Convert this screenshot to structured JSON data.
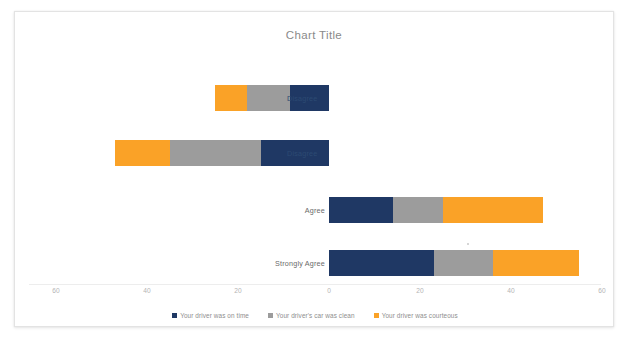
{
  "chart": {
    "title": "Chart Title",
    "background": "#ffffff"
  },
  "colors": {
    "on_time": "#1F3864",
    "car_clean": "#9C9C9C",
    "courteous": "#FAA227"
  },
  "legend": {
    "items": [
      {
        "label": "Your driver was on time",
        "color": "#1F3864",
        "key": "on_time"
      },
      {
        "label": "Your driver's car was clean",
        "color": "#9C9C9C",
        "key": "car_clean"
      },
      {
        "label": "Your driver was courteous",
        "color": "#FAA227",
        "key": "courteous"
      }
    ]
  },
  "axis": {
    "ticks": [
      "60",
      "40",
      "20",
      "0",
      "20",
      "40",
      "60"
    ],
    "tick_values": [
      -60,
      -40,
      -20,
      0,
      20,
      40,
      60
    ],
    "min": -60,
    "max": 60
  },
  "categories": {
    "labels": [
      "Disagree",
      "Disagree",
      "Agree",
      "Strongly Agree"
    ],
    "label_0": "Disagree",
    "label_1": "Disagree",
    "label_2": "Agree",
    "label_3": "Strongly Agree"
  },
  "chart_data": {
    "type": "bar",
    "subtype": "diverging-stacked-bar",
    "orientation": "horizontal",
    "title": "Chart Title",
    "xlabel": "",
    "ylabel": "",
    "xlim": [
      -60,
      60
    ],
    "grid": false,
    "legend_position": "bottom",
    "categories": [
      "Disagree",
      "Disagree",
      "Agree",
      "Strongly Agree"
    ],
    "series": [
      {
        "name": "Your driver was on time",
        "color": "#1F3864",
        "values": [
          -8.5,
          -15,
          14,
          23
        ]
      },
      {
        "name": "Your driver's car was clean",
        "color": "#9C9C9C",
        "values": [
          -9.5,
          -20,
          11,
          13
        ]
      },
      {
        "name": "Your driver was courteous",
        "color": "#FAA227",
        "values": [
          -7,
          -12,
          22,
          19
        ]
      }
    ],
    "bars": [
      {
        "category": "Disagree",
        "segments": [
          {
            "series": "Your driver was courteous",
            "color": "#FAA227",
            "start": -25,
            "end": -18
          },
          {
            "series": "Your driver's car was clean",
            "color": "#9C9C9C",
            "start": -18,
            "end": -8.5
          },
          {
            "series": "Your driver was on time",
            "color": "#1F3864",
            "start": -8.5,
            "end": 0
          }
        ]
      },
      {
        "category": "Disagree",
        "segments": [
          {
            "series": "Your driver was courteous",
            "color": "#FAA227",
            "start": -47,
            "end": -35
          },
          {
            "series": "Your driver's car was clean",
            "color": "#9C9C9C",
            "start": -35,
            "end": -15
          },
          {
            "series": "Your driver was on time",
            "color": "#1F3864",
            "start": -15,
            "end": 0
          }
        ]
      },
      {
        "category": "Agree",
        "segments": [
          {
            "series": "Your driver was on time",
            "color": "#1F3864",
            "start": 0,
            "end": 14
          },
          {
            "series": "Your driver's car was clean",
            "color": "#9C9C9C",
            "start": 14,
            "end": 25
          },
          {
            "series": "Your driver was courteous",
            "color": "#FAA227",
            "start": 25,
            "end": 47
          }
        ]
      },
      {
        "category": "Strongly Agree",
        "segments": [
          {
            "series": "Your driver was on time",
            "color": "#1F3864",
            "start": 0,
            "end": 23
          },
          {
            "series": "Your driver's car was clean",
            "color": "#9C9C9C",
            "start": 23,
            "end": 36
          },
          {
            "series": "Your driver was courteous",
            "color": "#FAA227",
            "start": 36,
            "end": 55
          }
        ]
      }
    ]
  }
}
